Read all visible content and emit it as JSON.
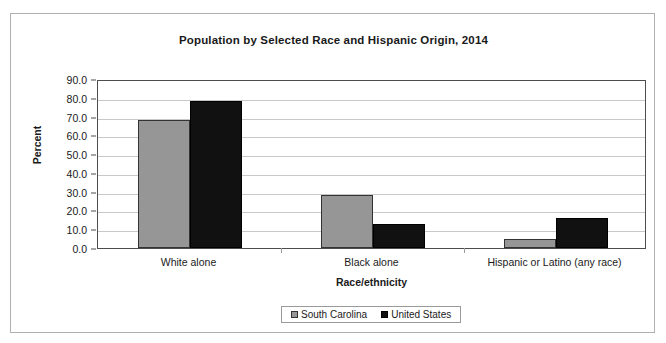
{
  "chart_data": {
    "type": "bar",
    "title": "Population by Selected Race and Hispanic Origin, 2014",
    "xlabel": "Race/ethnicity",
    "ylabel": "Percent",
    "categories": [
      "White alone",
      "Black alone",
      "Hispanic or Latino (any race)"
    ],
    "series": [
      {
        "name": "South Carolina",
        "color": "#969696",
        "values": [
          68.3,
          28.2,
          4.8
        ]
      },
      {
        "name": "United States",
        "color": "#111111",
        "values": [
          78.4,
          12.9,
          16.1
        ]
      }
    ],
    "ylim": [
      0.0,
      90.0
    ],
    "ytick_step": 10.0,
    "yticks": [
      "90.0",
      "80.0",
      "70.0",
      "60.0",
      "50.0",
      "40.0",
      "30.0",
      "20.0",
      "10.0",
      "0.0"
    ],
    "grid": true,
    "legend_position": "bottom"
  },
  "legend": {
    "entries": [
      {
        "label": "South Carolina"
      },
      {
        "label": "United States"
      }
    ]
  }
}
